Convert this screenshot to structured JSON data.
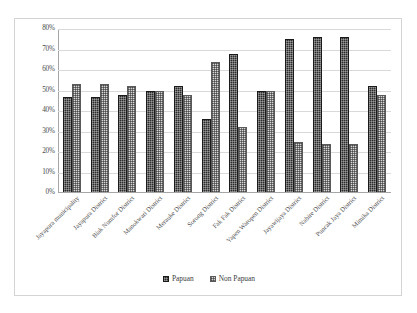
{
  "chart_data": {
    "type": "bar",
    "title": "",
    "xlabel": "",
    "ylabel": "",
    "ylim": [
      0,
      80
    ],
    "ytick_labels": [
      "80%",
      "70%",
      "60%",
      "50%",
      "40%",
      "30%",
      "20%",
      "10%",
      "0%"
    ],
    "ytick_values": [
      80,
      70,
      60,
      50,
      40,
      30,
      20,
      10,
      0
    ],
    "grid": true,
    "legend_position": "bottom",
    "categories": [
      "Jayapura municipality",
      "Jayapura District",
      "Biak Numfor District",
      "Manokwari District",
      "Merauke District",
      "Sorong District",
      "Fak Fak District",
      "Yapen Waropen District",
      "Jayawijaya District",
      "Nabire District",
      "Puncak Jaya District",
      "Mimika District"
    ],
    "series": [
      {
        "name": "Papuan",
        "color": "#2b2b2b",
        "values": [
          47,
          47,
          48,
          50,
          52,
          36,
          68,
          50,
          75,
          76,
          76,
          52
        ]
      },
      {
        "name": "Non Papuan",
        "color": "#d8d8d8",
        "values": [
          53,
          53,
          52,
          50,
          48,
          64,
          32,
          50,
          25,
          24,
          24,
          48
        ]
      }
    ]
  },
  "legend": {
    "items": [
      {
        "label": "Papuan"
      },
      {
        "label": "Non Papuan"
      }
    ]
  }
}
